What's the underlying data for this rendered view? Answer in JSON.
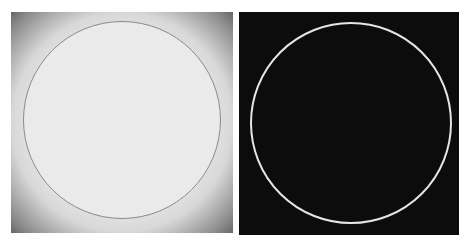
{
  "panels": [
    {
      "name": "original-grayscale-image",
      "background": "#eeeeee",
      "vignette": "#3a3a3a",
      "circle_stroke": "#8a8a8a"
    },
    {
      "name": "edge-detected-image",
      "background": "#0c0c0c",
      "circle_stroke": "#e6e6e6"
    }
  ]
}
